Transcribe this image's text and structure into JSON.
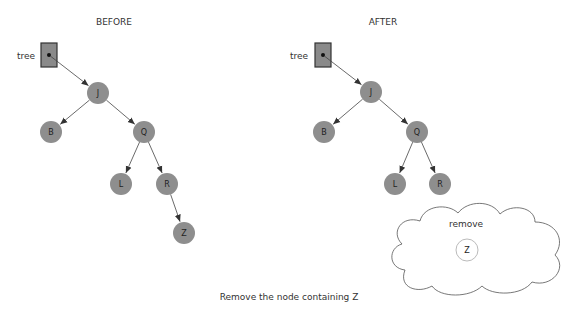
{
  "before": {
    "title": "BEFORE",
    "pointer_label": "tree",
    "nodes": [
      {
        "id": "J",
        "label": "J",
        "x": 98,
        "y": 93
      },
      {
        "id": "B",
        "label": "B",
        "x": 51,
        "y": 132
      },
      {
        "id": "Q",
        "label": "Q",
        "x": 144,
        "y": 132
      },
      {
        "id": "L",
        "label": "L",
        "x": 121,
        "y": 184
      },
      {
        "id": "R",
        "label": "R",
        "x": 167,
        "y": 184
      },
      {
        "id": "Z",
        "label": "Z",
        "x": 184,
        "y": 233
      }
    ],
    "edges": [
      [
        "J",
        "B"
      ],
      [
        "J",
        "Q"
      ],
      [
        "Q",
        "L"
      ],
      [
        "Q",
        "R"
      ],
      [
        "R",
        "Z"
      ]
    ],
    "pointer": {
      "x": 41,
      "y": 43,
      "w": 16,
      "h": 24,
      "target": "J"
    }
  },
  "after": {
    "title": "AFTER",
    "pointer_label": "tree",
    "nodes": [
      {
        "id": "J",
        "label": "J",
        "x": 371,
        "y": 92
      },
      {
        "id": "B",
        "label": "B",
        "x": 324,
        "y": 132
      },
      {
        "id": "Q",
        "label": "Q",
        "x": 417,
        "y": 132
      },
      {
        "id": "L",
        "label": "L",
        "x": 395,
        "y": 184
      },
      {
        "id": "R",
        "label": "R",
        "x": 440,
        "y": 184
      }
    ],
    "edges": [
      [
        "J",
        "B"
      ],
      [
        "J",
        "Q"
      ],
      [
        "Q",
        "L"
      ],
      [
        "Q",
        "R"
      ]
    ],
    "pointer": {
      "x": 315,
      "y": 43,
      "w": 16,
      "h": 24,
      "target": "J"
    }
  },
  "removed": {
    "label": "remove",
    "node": {
      "label": "Z",
      "x": 467,
      "y": 250
    }
  },
  "caption": "Remove the node containing Z",
  "colors": {
    "node_fill": "#8e8e8e",
    "edge": "#444444",
    "removed_stroke": "#bbbbbb"
  }
}
